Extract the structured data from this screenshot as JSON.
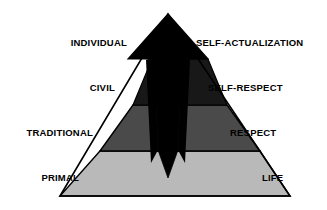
{
  "diagram": {
    "type": "pyramid",
    "title": "",
    "tiers": [
      {
        "index": 0,
        "position": "apex",
        "left_label": "INDIVIDUAL",
        "right_label": "SELF-ACTUALIZATION",
        "fill": "#000000"
      },
      {
        "index": 1,
        "position": "upper-middle",
        "left_label": "CIVIL",
        "right_label": "SELF-RESPECT",
        "fill": "#181818"
      },
      {
        "index": 2,
        "position": "lower-middle",
        "left_label": "TRADITIONAL",
        "right_label": "RESPECT",
        "fill": "#4a4a4a"
      },
      {
        "index": 3,
        "position": "base",
        "left_label": "PRIMAL",
        "right_label": "LIFE",
        "fill": "#b9b9b9"
      }
    ],
    "center_wedge": {
      "name": "central-black-wedge",
      "fill": "#000000",
      "description": "black wedge descending from apex to a point near the base"
    },
    "colors": {
      "background": "#ffffff",
      "outline": "#000000",
      "apex_fill": "#000000",
      "civil_fill": "#181818",
      "traditional_fill": "#4a4a4a",
      "primal_fill": "#b9b9b9",
      "text": "#000000"
    }
  }
}
